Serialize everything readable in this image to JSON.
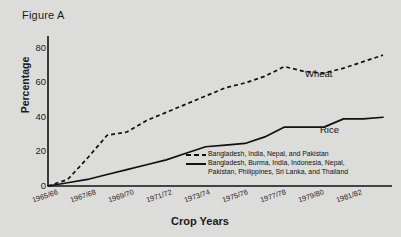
{
  "figure": {
    "title": "Figure A"
  },
  "chart_data": {
    "type": "line",
    "title": "Figure A",
    "xlabel": "Crop Years",
    "ylabel": "Percentage",
    "ylim": [
      0,
      88
    ],
    "yticks": [
      0,
      20,
      40,
      60,
      80
    ],
    "grid": false,
    "legend_position": "inside-center-right",
    "categories": [
      "1965/66",
      "1966/67",
      "1967/68",
      "1968/69",
      "1969/70",
      "1970/71",
      "1971/72",
      "1972/73",
      "1973/74",
      "1974/75",
      "1975/76",
      "1976/77",
      "1977/78",
      "1978/79",
      "1979/80",
      "1980/81",
      "1981/82",
      "1982/83"
    ],
    "xtick_labels": [
      "1965/66",
      "1967/68",
      "1969/70",
      "1971/72",
      "1973/74",
      "1975/76",
      "1977/78",
      "1979/80",
      "1981/82"
    ],
    "series": [
      {
        "name": "Wheat",
        "style": "dashed",
        "legend": "Bangladesh, India, Nepal, and Pakistan",
        "values": [
          0,
          4,
          17,
          31,
          33,
          40,
          45,
          50,
          55,
          60,
          63,
          67,
          73,
          70,
          69,
          72,
          76,
          80
        ]
      },
      {
        "name": "Rice",
        "style": "solid",
        "legend": "Bangladesh, Burma, India, Indonesia, Nepal,\nPakistan, Philippines, Sri Lanka, and Thailand",
        "values": [
          0,
          2,
          4,
          7,
          10,
          13,
          16,
          20,
          24,
          25,
          26,
          30,
          36,
          36,
          36,
          41,
          41,
          42
        ]
      }
    ],
    "annotations": [
      {
        "text": "Wheat",
        "series": "Wheat"
      },
      {
        "text": "Rice",
        "series": "Rice"
      }
    ]
  },
  "axis": {
    "ytick_labels": [
      "0",
      "20",
      "40",
      "60",
      "80"
    ],
    "xaxis_title": "Crop Years",
    "yaxis_title": "Percentage"
  }
}
